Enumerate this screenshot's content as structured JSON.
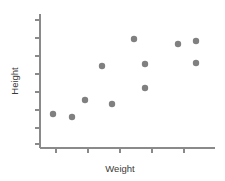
{
  "chart_data": {
    "type": "scatter",
    "title": "",
    "subtitle": "",
    "xlabel": "Weight",
    "ylabel": "Height",
    "grid": false,
    "legend": false,
    "legend_position": "none",
    "point_color": "#808080",
    "axis_color": "#8a8a8a",
    "background_color": "#ffffff",
    "point_radius_px": 3.2,
    "xlim": [
      0,
      10
    ],
    "ylim": [
      0,
      10
    ],
    "x_tick_labels": [
      "",
      "",
      "",
      "",
      ""
    ],
    "y_tick_labels": [
      "",
      "",
      "",
      "",
      "",
      "",
      "",
      ""
    ],
    "x_tick_count": 5,
    "y_tick_count": 8,
    "series": [
      {
        "name": "observations",
        "points": [
          {
            "px": 53,
            "py": 114
          },
          {
            "px": 72,
            "py": 117
          },
          {
            "px": 85,
            "py": 100
          },
          {
            "px": 102,
            "py": 66
          },
          {
            "px": 112,
            "py": 104
          },
          {
            "px": 134,
            "py": 39
          },
          {
            "px": 145,
            "py": 64
          },
          {
            "px": 145,
            "py": 88
          },
          {
            "px": 178,
            "py": 44
          },
          {
            "px": 196,
            "py": 41
          },
          {
            "px": 196,
            "py": 63
          }
        ]
      }
    ],
    "plot_area": {
      "left": 40,
      "right": 215,
      "top": 14,
      "bottom": 148
    },
    "x_tick_positions_px": [
      56,
      88,
      120,
      152,
      184
    ],
    "y_tick_positions_px": [
      20,
      38,
      56,
      74,
      92,
      110,
      128,
      144
    ]
  },
  "labels": {
    "x_axis_title": "Weight",
    "y_axis_title": "Height"
  }
}
